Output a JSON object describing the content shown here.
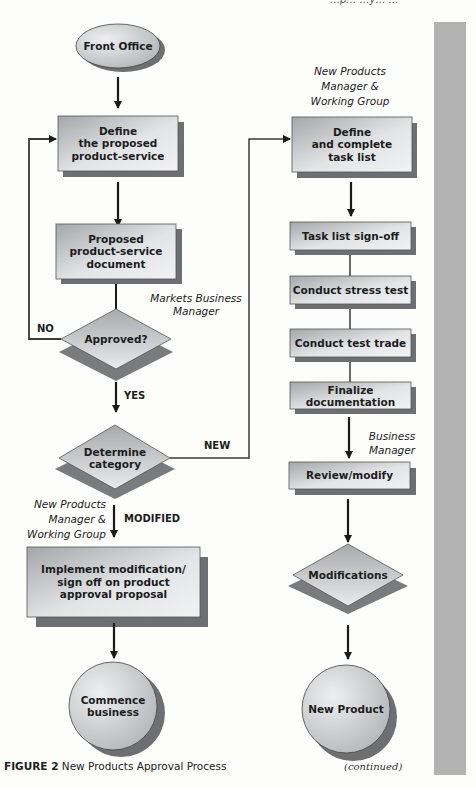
{
  "header_fragment": "…p… …y… …",
  "figure": {
    "caption_label": "FIGURE 2",
    "caption_text": "New Products Approval Process",
    "continued": "(continued)"
  },
  "colors": {
    "shape_fill_light": "#e6e7e9",
    "shape_fill_dark": "#a9abae",
    "shadow": "#6e6f72",
    "sidebar": "#b3b3b3",
    "line": "#2a2a2a"
  },
  "nodes": {
    "front_office": {
      "type": "ellipse",
      "label": "Front Office"
    },
    "define_proposed": {
      "type": "box",
      "label": "Define the proposed product-service",
      "lines": [
        "Define",
        "the proposed",
        "product-service"
      ]
    },
    "proposed_doc": {
      "type": "box",
      "label": "Proposed product-service document",
      "lines": [
        "Proposed",
        "product-service",
        "document"
      ]
    },
    "approved": {
      "type": "diamond",
      "label": "Approved?"
    },
    "determine_category": {
      "type": "diamond",
      "label": "Determine category",
      "lines": [
        "Determine",
        "category"
      ]
    },
    "implement_mod": {
      "type": "box",
      "label": "Implement modification/ sign off on product approval proposal",
      "lines": [
        "Implement modification/",
        "sign off on product",
        "approval proposal"
      ]
    },
    "commence": {
      "type": "circle",
      "label": "Commence business",
      "lines": [
        "Commence",
        "business"
      ]
    },
    "define_task": {
      "type": "box",
      "label": "Define and complete task list",
      "lines": [
        "Define",
        "and complete",
        "task list"
      ]
    },
    "task_signoff": {
      "type": "box",
      "label": "Task list sign-off"
    },
    "stress_test": {
      "type": "box",
      "label": "Conduct stress test"
    },
    "test_trade": {
      "type": "box",
      "label": "Conduct test trade"
    },
    "finalize_doc": {
      "type": "box",
      "label": "Finalize documentation",
      "lines": [
        "Finalize",
        "documentation"
      ]
    },
    "review_modify": {
      "type": "box",
      "label": "Review/modify"
    },
    "modifications": {
      "type": "diamond",
      "label": "Modifications"
    },
    "new_product": {
      "type": "circle",
      "label": "New Product"
    }
  },
  "annotations": {
    "markets_business_manager": [
      "Markets Business",
      "Manager"
    ],
    "npm_right": [
      "New Products",
      "Manager &",
      "Working Group"
    ],
    "npm_left": [
      "New Products",
      "Manager &",
      "Working Group"
    ],
    "business_manager": [
      "Business",
      "Manager"
    ]
  },
  "edge_labels": {
    "no": "NO",
    "yes": "YES",
    "new": "NEW",
    "modified": "MODIFIED"
  },
  "edges": [
    {
      "from": "front_office",
      "to": "define_proposed"
    },
    {
      "from": "define_proposed",
      "to": "proposed_doc"
    },
    {
      "from": "proposed_doc",
      "to": "approved"
    },
    {
      "from": "approved",
      "to": "define_proposed",
      "label": "NO"
    },
    {
      "from": "approved",
      "to": "determine_category",
      "label": "YES"
    },
    {
      "from": "determine_category",
      "to": "define_task",
      "label": "NEW"
    },
    {
      "from": "determine_category",
      "to": "implement_mod",
      "label": "MODIFIED"
    },
    {
      "from": "implement_mod",
      "to": "commence"
    },
    {
      "from": "define_task",
      "to": "task_signoff"
    },
    {
      "from": "task_signoff",
      "to": "stress_test"
    },
    {
      "from": "stress_test",
      "to": "test_trade"
    },
    {
      "from": "test_trade",
      "to": "finalize_doc"
    },
    {
      "from": "finalize_doc",
      "to": "review_modify"
    },
    {
      "from": "review_modify",
      "to": "modifications"
    },
    {
      "from": "modifications",
      "to": "new_product"
    }
  ]
}
